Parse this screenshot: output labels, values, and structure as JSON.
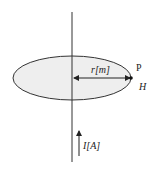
{
  "diagram": {
    "labels": {
      "radius": "r[m]",
      "point": "P",
      "field": "H",
      "current": "I[A]"
    },
    "colors": {
      "stroke": "#333333",
      "fill": "#eeeeee"
    }
  }
}
